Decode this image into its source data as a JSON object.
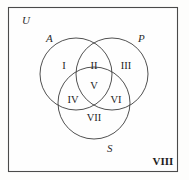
{
  "figure": {
    "background_color": "#fdfdfc",
    "border_color": "#4a4a4a",
    "circle_stroke_color": "#3d3d3d",
    "text_color": "#1f1f1f"
  },
  "universe": {
    "label": "U",
    "x": 22,
    "y": 24
  },
  "sets": [
    {
      "name": "set-a",
      "label": "A",
      "cx": 76,
      "cy": 74,
      "r": 36,
      "label_x": 46,
      "label_y": 42
    },
    {
      "name": "set-p",
      "label": "P",
      "cx": 112,
      "cy": 74,
      "r": 36,
      "label_x": 138,
      "label_y": 42
    },
    {
      "name": "set-s",
      "label": "S",
      "cx": 94,
      "cy": 103,
      "r": 36,
      "label_x": 107,
      "label_y": 152
    }
  ],
  "regions": [
    {
      "name": "region-i",
      "label": "I",
      "x": 64,
      "y": 69,
      "description": "A only"
    },
    {
      "name": "region-ii",
      "label": "II",
      "x": 94,
      "y": 69,
      "description": "A and P only"
    },
    {
      "name": "region-iii",
      "label": "III",
      "x": 126,
      "y": 69,
      "description": "P only"
    },
    {
      "name": "region-iv",
      "label": "IV",
      "x": 73,
      "y": 103,
      "description": "A and S only"
    },
    {
      "name": "region-v",
      "label": "V",
      "x": 94,
      "y": 89,
      "description": "A and P and S"
    },
    {
      "name": "region-vi",
      "label": "VI",
      "x": 116,
      "y": 103,
      "description": "P and S only"
    },
    {
      "name": "region-vii",
      "label": "VII",
      "x": 94,
      "y": 121,
      "description": "S only"
    },
    {
      "name": "region-viii",
      "label": "VIII",
      "x": 163,
      "y": 165,
      "description": "outside all sets"
    }
  ],
  "chart_data": {
    "type": "diagram",
    "diagram_type": "venn",
    "set_count": 3,
    "sets": [
      "A",
      "P",
      "S"
    ],
    "universe": "U",
    "region_labels": [
      "I",
      "II",
      "III",
      "IV",
      "V",
      "VI",
      "VII",
      "VIII"
    ],
    "region_map": {
      "I": "A",
      "II": "A∩P",
      "III": "P",
      "IV": "A∩S",
      "V": "A∩P∩S",
      "VI": "P∩S",
      "VII": "S",
      "VIII": "U complement"
    }
  }
}
